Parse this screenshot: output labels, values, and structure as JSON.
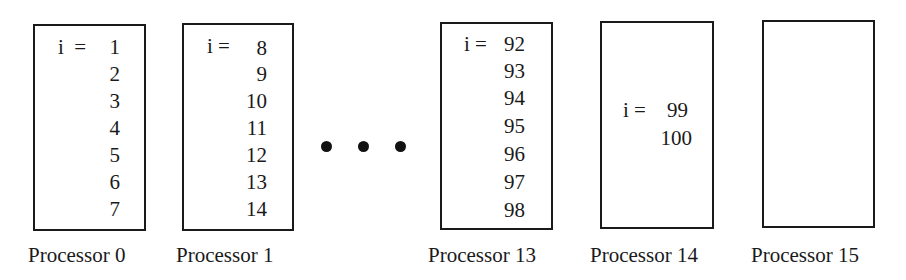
{
  "processors": [
    {
      "label": "Processor 0",
      "prefix": "i  =",
      "values": [
        "1",
        "2",
        "3",
        "4",
        "5",
        "6",
        "7"
      ]
    },
    {
      "label": "Processor 1",
      "prefix": "i =",
      "values": [
        "8",
        "9",
        "10",
        "11",
        "12",
        "13",
        "14"
      ]
    },
    {
      "label": "Processor 13",
      "prefix": "i =",
      "values": [
        "92",
        "93",
        "94",
        "95",
        "96",
        "97",
        "98"
      ]
    },
    {
      "label": "Processor 14",
      "prefix": "i =",
      "values": [
        "99",
        "100"
      ]
    },
    {
      "label": "Processor 15",
      "prefix": "",
      "values": []
    }
  ],
  "ellipsis": "• • •"
}
